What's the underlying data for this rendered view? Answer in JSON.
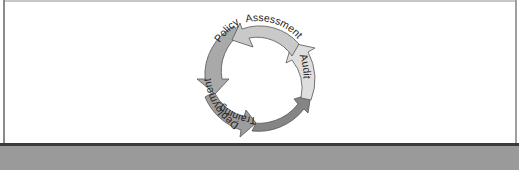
{
  "diagram": {
    "type": "cycle",
    "direction": "counterclockwise",
    "stages": [
      {
        "label": "Assessment",
        "color": "#c9c9c9"
      },
      {
        "label": "Policy",
        "color": "#a9a9a9"
      },
      {
        "label": "Deployment",
        "color": "#9d9d9d"
      },
      {
        "label": "Training",
        "color": "#858585"
      },
      {
        "label": "Audit",
        "color": "#dedede"
      }
    ]
  },
  "colors": {
    "outline": "#555555",
    "bottom_band": "#3a3a3a",
    "bottom_strip": "#9a9a9a"
  }
}
